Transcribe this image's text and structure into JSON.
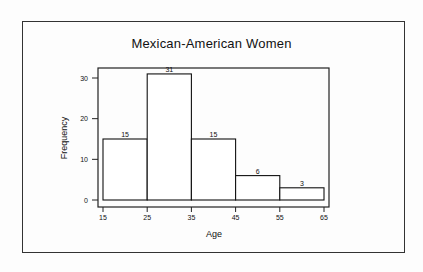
{
  "chart_data": {
    "type": "bar",
    "subtype": "histogram",
    "title": "Mexican-American Women",
    "xlabel": "Age",
    "ylabel": "Frequency",
    "bin_edges": [
      15,
      25,
      35,
      45,
      55,
      65
    ],
    "categories": [
      "15-25",
      "25-35",
      "35-45",
      "45-55",
      "55-65"
    ],
    "values": [
      15,
      31,
      15,
      6,
      3
    ],
    "data_labels": [
      "15",
      "31",
      "15",
      "6",
      "3"
    ],
    "x_ticks": [
      "15",
      "25",
      "35",
      "45",
      "55",
      "65"
    ],
    "y_ticks": [
      "0",
      "10",
      "20",
      "30"
    ],
    "xlim": [
      15,
      65
    ],
    "ylim": [
      0,
      32
    ],
    "grid": false,
    "legend": null
  }
}
